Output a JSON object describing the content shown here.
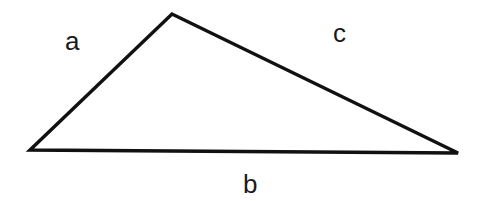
{
  "diagram": {
    "type": "triangle",
    "stroke_color": "#111111",
    "vertices": {
      "left": [
        30,
        150
      ],
      "top": [
        172,
        14
      ],
      "right": [
        458,
        153
      ]
    },
    "labels": {
      "a": "a",
      "b": "b",
      "c": "c"
    }
  }
}
